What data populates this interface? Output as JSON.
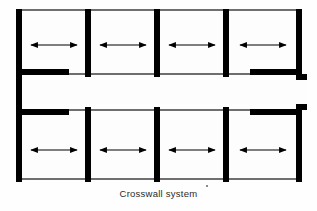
{
  "figure": {
    "caption": "Crosswall system",
    "caption_marker": "*",
    "title": "Crosswall system floor plan diagram",
    "colors": {
      "wall": "#000000",
      "thin_line": "#6f6f6f",
      "background": "#fefefe",
      "room_fill": "#fdfdfd",
      "caption_text": "#2b2b2b"
    }
  },
  "plan": {
    "type": "architectural-floor-plan",
    "description": "Double-loaded corridor building with transverse loadbearing crosswalls; rooms on both sides of a central corridor. Double-headed arrows in each room indicate the horizontal span direction of the floor structure, running perpendicular to the crosswalls.",
    "outline": {
      "x": 16,
      "y": 9,
      "width": 286,
      "height": 173
    },
    "wall_thickness": 6,
    "thin_wall_thickness": 2,
    "corridor": {
      "label": "central corridor",
      "y": 75,
      "height": 34,
      "x_start": 22,
      "x_end": 307,
      "notch": {
        "x": 296,
        "y": 80,
        "width": 11,
        "height": 24
      }
    },
    "crosswalls": [
      {
        "id": "crosswall-1",
        "x": 16,
        "label": "end wall left"
      },
      {
        "id": "crosswall-2",
        "x": 85,
        "label": "crosswall"
      },
      {
        "id": "crosswall-3",
        "x": 154,
        "label": "crosswall"
      },
      {
        "id": "crosswall-4",
        "x": 223,
        "label": "crosswall"
      },
      {
        "id": "crosswall-5",
        "x": 296,
        "label": "end wall right"
      }
    ],
    "corridor_wall_segments": {
      "top": [
        {
          "x": 22,
          "width": 47,
          "type": "thick"
        },
        {
          "x": 250,
          "width": 52,
          "type": "thick"
        }
      ],
      "bottom": [
        {
          "x": 22,
          "width": 47,
          "type": "thick"
        },
        {
          "x": 250,
          "width": 52,
          "type": "thick"
        }
      ]
    },
    "rooms": [
      {
        "id": "room-top-1",
        "row": "top",
        "index": 1,
        "x": 22,
        "y": 11,
        "width": 63,
        "height": 64,
        "span_arrow": "horizontal-double"
      },
      {
        "id": "room-top-2",
        "row": "top",
        "index": 2,
        "x": 91,
        "y": 11,
        "width": 63,
        "height": 64,
        "span_arrow": "horizontal-double"
      },
      {
        "id": "room-top-3",
        "row": "top",
        "index": 3,
        "x": 160,
        "y": 11,
        "width": 63,
        "height": 64,
        "span_arrow": "horizontal-double"
      },
      {
        "id": "room-top-4",
        "row": "top",
        "index": 4,
        "x": 229,
        "y": 11,
        "width": 67,
        "height": 64,
        "span_arrow": "horizontal-double"
      },
      {
        "id": "room-bottom-1",
        "row": "bottom",
        "index": 1,
        "x": 22,
        "y": 109,
        "width": 63,
        "height": 71,
        "span_arrow": "horizontal-double"
      },
      {
        "id": "room-bottom-2",
        "row": "bottom",
        "index": 2,
        "x": 91,
        "y": 109,
        "width": 63,
        "height": 71,
        "span_arrow": "horizontal-double"
      },
      {
        "id": "room-bottom-3",
        "row": "bottom",
        "index": 3,
        "x": 160,
        "y": 109,
        "width": 63,
        "height": 71,
        "span_arrow": "horizontal-double"
      },
      {
        "id": "room-bottom-4",
        "row": "bottom",
        "index": 4,
        "x": 229,
        "y": 109,
        "width": 67,
        "height": 71,
        "span_arrow": "horizontal-double"
      }
    ],
    "arrows": [
      {
        "id": "span-arrow-top-1",
        "cx": 54,
        "cy": 45,
        "half_length": 23
      },
      {
        "id": "span-arrow-top-2",
        "cx": 123,
        "cy": 45,
        "half_length": 23
      },
      {
        "id": "span-arrow-top-3",
        "cx": 192,
        "cy": 45,
        "half_length": 23
      },
      {
        "id": "span-arrow-top-4",
        "cx": 263,
        "cy": 45,
        "half_length": 23
      },
      {
        "id": "span-arrow-bottom-1",
        "cx": 54,
        "cy": 150,
        "half_length": 23
      },
      {
        "id": "span-arrow-bottom-2",
        "cx": 123,
        "cy": 150,
        "half_length": 23
      },
      {
        "id": "span-arrow-bottom-3",
        "cx": 192,
        "cy": 150,
        "half_length": 23
      },
      {
        "id": "span-arrow-bottom-4",
        "cx": 263,
        "cy": 150,
        "half_length": 23
      }
    ]
  }
}
